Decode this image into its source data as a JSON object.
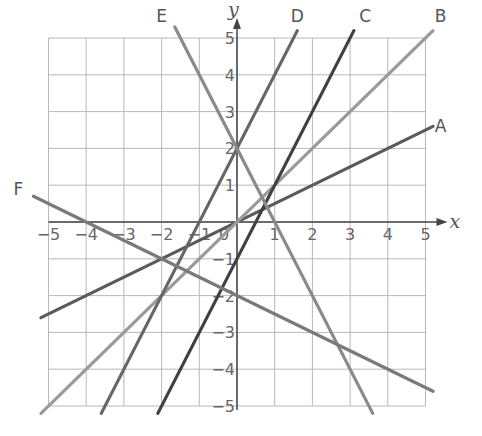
{
  "chart_data": {
    "type": "line",
    "title": "",
    "xlabel": "x",
    "ylabel": "y",
    "xlim": [
      -5,
      5
    ],
    "ylim": [
      -5,
      5
    ],
    "grid": true,
    "x_ticks": [
      "-5",
      "-4",
      "-3",
      "-2",
      "-1",
      "0",
      "1",
      "2",
      "3",
      "4",
      "5"
    ],
    "y_ticks": [
      "5",
      "4",
      "3",
      "2",
      "1",
      "-1",
      "-2",
      "-3",
      "-4",
      "-5"
    ],
    "series": [
      {
        "name": "A",
        "equation": "y = 0.5x",
        "slope": 0.5,
        "intercept": 0,
        "x": [
          -5.2,
          5.2
        ],
        "values": [
          -2.6,
          2.6
        ],
        "color": "#5a5a5a",
        "label_pos": [
          5.4,
          2.6
        ]
      },
      {
        "name": "B",
        "equation": "y = x",
        "slope": 1,
        "intercept": 0,
        "x": [
          -5.2,
          5.2
        ],
        "values": [
          -5.2,
          5.2
        ],
        "color": "#9a9a9a",
        "label_pos": [
          5.4,
          5.6
        ]
      },
      {
        "name": "C",
        "equation": "y = 2x - 1",
        "slope": 2,
        "intercept": -1,
        "x": [
          -2.1,
          3.1
        ],
        "values": [
          -5.2,
          5.2
        ],
        "color": "#404040",
        "label_pos": [
          3.4,
          5.6
        ]
      },
      {
        "name": "D",
        "equation": "y = 2x + 2",
        "slope": 2,
        "intercept": 2,
        "x": [
          -3.6,
          1.6
        ],
        "values": [
          -5.2,
          5.2
        ],
        "color": "#666666",
        "label_pos": [
          1.6,
          5.6
        ]
      },
      {
        "name": "E",
        "equation": "y = -2x + 2",
        "slope": -2,
        "intercept": 2,
        "x": [
          -1.65,
          3.6
        ],
        "values": [
          5.3,
          -5.2
        ],
        "color": "#8a8a8a",
        "label_pos": [
          -2.0,
          5.6
        ]
      },
      {
        "name": "F",
        "equation": "y = -0.5x - 2",
        "slope": -0.5,
        "intercept": -2,
        "x": [
          -5.4,
          5.2
        ],
        "values": [
          0.7,
          -4.6
        ],
        "color": "#7a7a7a",
        "label_pos": [
          -5.8,
          0.9
        ]
      }
    ]
  }
}
